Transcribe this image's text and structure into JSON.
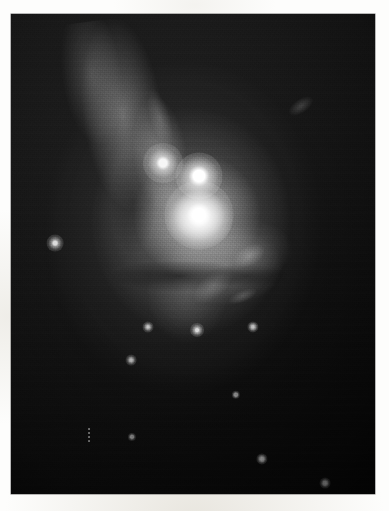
{
  "page": {
    "background_color": "#fdfdfc",
    "width": 389,
    "height": 511
  },
  "plate": {
    "name": "astronomical-plate",
    "caption": "",
    "frame": {
      "x": 11,
      "y": 14,
      "width": 364,
      "height": 480
    },
    "colors": {
      "sky_dark": "#070707",
      "sky_light": "#232323",
      "nebula": "#bdbdbd",
      "core_highlight": "#ffffff",
      "paper": "#fdfdfc"
    },
    "description": "Grayscale astronomical photograph of a bright nebulous object with a luminous core, two compact bright knots, a diffuse plume extending to the upper left, a dark dust lane, and several faint field stars on a dark sky background."
  },
  "features": {
    "knots": [
      {
        "name": "bright-star-knot",
        "cx": 199,
        "cy": 176,
        "r": 7.5,
        "peak": "#ffffff",
        "halo": 16
      },
      {
        "name": "core-knot",
        "cx": 199,
        "cy": 215,
        "r": 8.5,
        "peak": "#ffffff",
        "halo": 26
      },
      {
        "name": "west-knot",
        "cx": 163,
        "cy": 163,
        "r": 5.0,
        "peak": "#efefef",
        "halo": 15
      }
    ],
    "field_stars": [
      {
        "name": "field-star-left",
        "cx": 55,
        "cy": 243,
        "r": 2.4,
        "peak": "#e6e6e6",
        "halo": 6
      },
      {
        "name": "field-star-lower-a",
        "cx": 197,
        "cy": 330,
        "r": 1.9,
        "peak": "#d2d2d2",
        "halo": 5
      },
      {
        "name": "field-star-lower-b",
        "cx": 148,
        "cy": 327,
        "r": 1.5,
        "peak": "#bdbdbd",
        "halo": 4
      },
      {
        "name": "field-star-lower-c",
        "cx": 131,
        "cy": 360,
        "r": 1.4,
        "peak": "#b0b0b0",
        "halo": 4
      },
      {
        "name": "field-star-lower-d",
        "cx": 253,
        "cy": 327,
        "r": 1.6,
        "peak": "#b8b8b8",
        "halo": 4
      },
      {
        "name": "field-star-lower-e",
        "cx": 262,
        "cy": 459,
        "r": 1.6,
        "peak": "#a8a8a8",
        "halo": 4
      },
      {
        "name": "field-star-lower-f",
        "cx": 325,
        "cy": 483,
        "r": 1.4,
        "peak": "#9a9a9a",
        "halo": 4
      },
      {
        "name": "field-star-lower-g",
        "cx": 236,
        "cy": 395,
        "r": 1.2,
        "peak": "#8c8c8c",
        "halo": 3
      },
      {
        "name": "field-star-lower-h",
        "cx": 132,
        "cy": 437,
        "r": 1.1,
        "peak": "#8a8a8a",
        "halo": 3
      }
    ],
    "wisps": [
      {
        "name": "wisp-upper-right",
        "cx": 301,
        "cy": 106,
        "rx": 14,
        "ry": 7,
        "rot": -34,
        "opacity": 0.2
      },
      {
        "name": "wisp-dust-knot",
        "cx": 249,
        "cy": 256,
        "rx": 17,
        "ry": 10,
        "rot": -28,
        "opacity": 0.26
      },
      {
        "name": "wisp-lower-left",
        "cx": 243,
        "cy": 296,
        "rx": 15,
        "ry": 6,
        "rot": -22,
        "opacity": 0.18
      },
      {
        "name": "wisp-arm-edge",
        "cx": 160,
        "cy": 118,
        "rx": 10,
        "ry": 30,
        "rot": -16,
        "opacity": 0.18
      },
      {
        "name": "wisp-halo-south",
        "cx": 213,
        "cy": 286,
        "rx": 24,
        "ry": 12,
        "rot": -40,
        "opacity": 0.16
      }
    ],
    "artifact": {
      "name": "emulsion-streak-artifact",
      "x": 88,
      "y": 428,
      "width": 2,
      "height": 15,
      "color": "#8f8f8f"
    }
  }
}
